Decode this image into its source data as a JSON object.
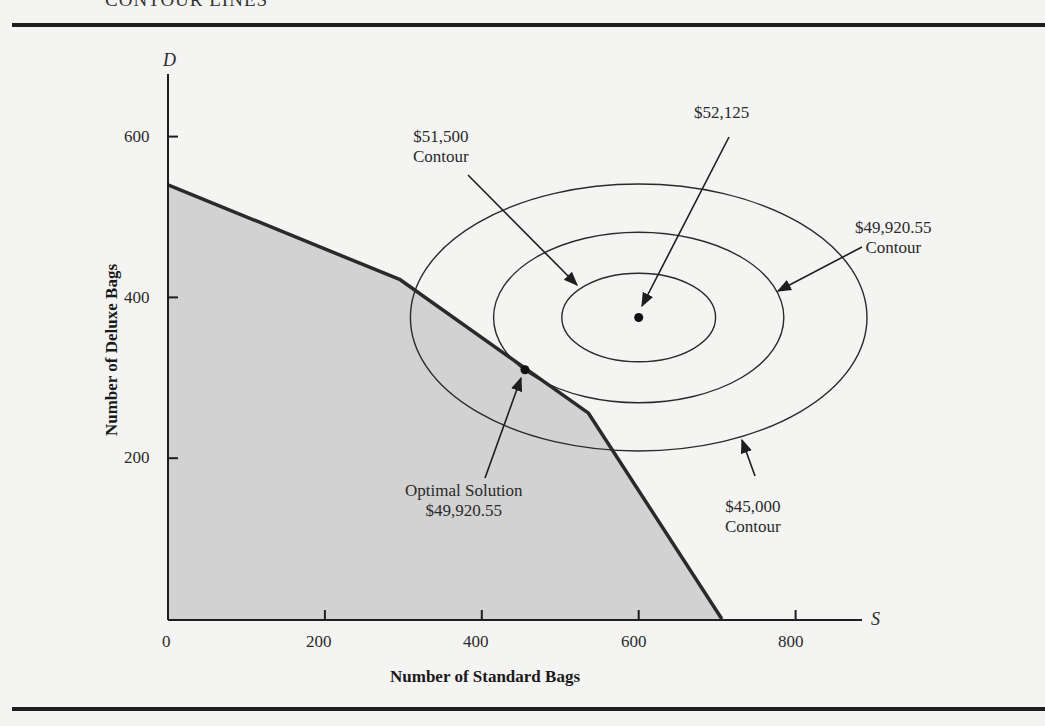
{
  "page": {
    "section_heading": "CONTOUR LINES"
  },
  "chart_data": {
    "type": "line",
    "title": "",
    "xlabel": "Number of Standard Bags",
    "ylabel": "Number of Deluxe Bags",
    "x_variable": "S",
    "y_variable": "D",
    "xlim": [
      0,
      880
    ],
    "ylim": [
      0,
      680
    ],
    "x_ticks": [
      0,
      200,
      400,
      600,
      800
    ],
    "y_ticks": [
      200,
      400,
      600
    ],
    "grid": false,
    "feasible_region": {
      "fill": "#d2d2d2",
      "vertices": [
        [
          0,
          0
        ],
        [
          0,
          540
        ],
        [
          296,
          422
        ],
        [
          536,
          256
        ],
        [
          706,
          0
        ]
      ]
    },
    "unconstrained_optimum": {
      "S": 600,
      "D": 375,
      "label": "$52,125"
    },
    "optimal_solution": {
      "S": 455,
      "D": 310,
      "label": "Optimal Solution",
      "value": "$49,920.55"
    },
    "contours": [
      {
        "name": "$51,500 Contour",
        "value": 51500,
        "center": [
          600,
          375
        ],
        "semi_axis_S": 98,
        "semi_axis_D": 55
      },
      {
        "name": "$49,920.55 Contour",
        "value": 49920.55,
        "center": [
          600,
          375
        ],
        "semi_axis_S": 185,
        "semi_axis_D": 106
      },
      {
        "name": "$45,000 Contour",
        "value": 45000,
        "center": [
          600,
          375
        ],
        "semi_axis_S": 291,
        "semi_axis_D": 166
      }
    ],
    "annotations": [
      {
        "text_line1": "$51,500",
        "text_line2": "Contour"
      },
      {
        "text_line1": "$52,125",
        "text_line2": ""
      },
      {
        "text_line1": "$49,920.55",
        "text_line2": "Contour"
      },
      {
        "text_line1": "Optimal Solution",
        "text_line2": "$49,920.55"
      },
      {
        "text_line1": "$45,000",
        "text_line2": "Contour"
      }
    ]
  }
}
